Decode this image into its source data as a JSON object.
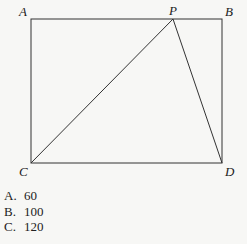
{
  "diagram": {
    "points": {
      "A": {
        "label": "A",
        "x": 31,
        "y": 19
      },
      "B": {
        "label": "B",
        "x": 222,
        "y": 19
      },
      "C": {
        "label": "C",
        "x": 31,
        "y": 163
      },
      "D": {
        "label": "D",
        "x": 222,
        "y": 163
      },
      "P": {
        "label": "P",
        "x": 173,
        "y": 19
      }
    },
    "segments": [
      [
        "A",
        "B"
      ],
      [
        "B",
        "D"
      ],
      [
        "D",
        "C"
      ],
      [
        "C",
        "A"
      ],
      [
        "C",
        "P"
      ],
      [
        "P",
        "D"
      ]
    ]
  },
  "choices": [
    {
      "letter": "A.",
      "value": "60"
    },
    {
      "letter": "B.",
      "value": "100"
    },
    {
      "letter": "C.",
      "value": "120"
    }
  ]
}
